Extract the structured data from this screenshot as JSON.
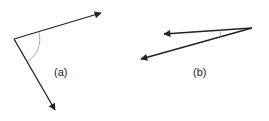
{
  "figures": [
    {
      "id": "a",
      "label": "(a)",
      "description": "Two vectors from a common origin forming a wide angle, marked with an arc",
      "origin": [
        14,
        39
      ],
      "vectors": [
        [
          103,
          12
        ],
        [
          56,
          112
        ]
      ]
    },
    {
      "id": "b",
      "label": "(b)",
      "description": "Two vectors from a common origin forming a narrow angle, marked with a small arc",
      "origin": [
        252,
        28
      ],
      "vectors": [
        [
          162,
          34
        ],
        [
          139,
          60
        ]
      ]
    }
  ],
  "colors": {
    "line": "#222222",
    "arc": "#888888"
  }
}
